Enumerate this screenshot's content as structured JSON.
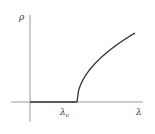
{
  "chart_data": {
    "type": "line",
    "title": "",
    "xlabel": "λ",
    "ylabel": "ρ",
    "annotations": [
      {
        "text": "λc",
        "position": "critical point on x-axis",
        "x": "λc"
      }
    ],
    "series": [
      {
        "name": "ρ(λ)",
        "description": "ρ = 0 for λ < λc; ρ grows as sqrt(λ - λc) for λ > λc",
        "x": [
          0,
          0.45,
          0.45,
          0.55,
          0.65,
          0.75,
          0.85,
          0.95,
          1.0
        ],
        "values": [
          0,
          0,
          0,
          0.36,
          0.51,
          0.62,
          0.72,
          0.8,
          0.84
        ]
      }
    ],
    "critical_x": 0.45,
    "xlim": [
      0,
      1.1
    ],
    "ylim": [
      0,
      1
    ],
    "grid": false,
    "ticks": "none"
  },
  "labels": {
    "y_axis": "ρ",
    "x_axis": "λ",
    "critical_main": "λ",
    "critical_sub": "c"
  },
  "colors": {
    "axis": "#9a9a9a",
    "curve": "#333333",
    "text": "#333333"
  }
}
